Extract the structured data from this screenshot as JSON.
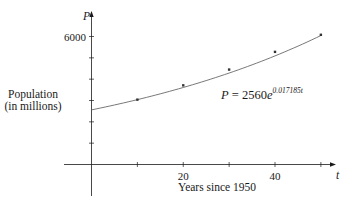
{
  "chart_data": {
    "type": "scatter",
    "title": "",
    "xlabel": "Years since 1950",
    "ylabel_line1": "Population",
    "ylabel_line2": "(in millions)",
    "x_axis_var": "t",
    "y_axis_var": "P",
    "xlim": [
      0,
      50
    ],
    "ylim": [
      0,
      6000
    ],
    "x_ticks": [
      10,
      20,
      30,
      40,
      50
    ],
    "x_tick_labels": [
      {
        "value": 20,
        "label": "20"
      },
      {
        "value": 40,
        "label": "40"
      }
    ],
    "y_ticks": [
      1000,
      2000,
      3000,
      4000,
      5000,
      6000
    ],
    "y_tick_labels": [
      {
        "value": 6000,
        "label": "6000"
      }
    ],
    "grid": false,
    "series": [
      {
        "name": "Observed population",
        "kind": "points",
        "x": [
          10,
          20,
          30,
          40,
          50
        ],
        "y": [
          3040,
          3710,
          4450,
          5280,
          6080
        ]
      },
      {
        "name": "Exponential model",
        "kind": "curve",
        "formula": "P = 2560e^(0.017185t)",
        "a": 2560,
        "k": 0.017185,
        "x_range": [
          0,
          50
        ]
      }
    ],
    "annotation": {
      "lhs": "P = 2560e",
      "exponent": "0.017185t",
      "x": 221,
      "y": 99
    }
  },
  "colors": {
    "axis": "#1a1a1a",
    "curve": "#555555",
    "point": "#333333"
  }
}
